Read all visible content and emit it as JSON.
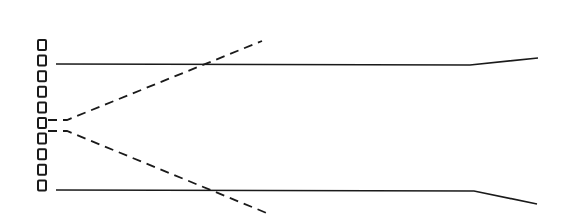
{
  "diagram": {
    "stroke_color": "#1a1a1a",
    "background": "#ffffff",
    "elements": {
      "count": 10,
      "x": 38,
      "width": 8,
      "height": 10,
      "start_y": 40,
      "spacing": 15.6
    },
    "solid_rays": [
      {
        "name": "upper-ray",
        "points": [
          [
            56,
            64
          ],
          [
            470,
            65
          ],
          [
            538,
            58
          ]
        ]
      },
      {
        "name": "lower-ray",
        "points": [
          [
            56,
            190
          ],
          [
            474,
            191
          ],
          [
            537,
            204
          ]
        ]
      }
    ],
    "dashed_rays": [
      {
        "name": "upper-dashed-ray",
        "points": [
          [
            48,
            120
          ],
          [
            67,
            120
          ],
          [
            262,
            41
          ]
        ]
      },
      {
        "name": "lower-dashed-ray",
        "points": [
          [
            48,
            131
          ],
          [
            67,
            131
          ],
          [
            269,
            214
          ]
        ]
      }
    ]
  }
}
